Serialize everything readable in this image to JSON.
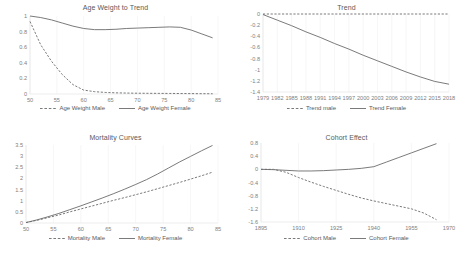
{
  "figure": {
    "panel_count": 4,
    "line_color": "#6b6b6b",
    "axis_color": "#d9d9d9",
    "text_color": "#595959"
  },
  "chart_data": [
    {
      "id": "age-weight-to-trend",
      "type": "line",
      "title": "Age Weight to Trend",
      "xlabel": "",
      "ylabel": "",
      "xlim": [
        50,
        85
      ],
      "ylim": [
        0,
        1
      ],
      "xticks": [
        50,
        55,
        60,
        65,
        70,
        75,
        80,
        85
      ],
      "yticks": [
        0,
        0.2,
        0.4,
        0.6,
        0.8,
        1
      ],
      "grid": true,
      "legend_position": "bottom",
      "x": [
        50,
        52,
        54,
        56,
        58,
        60,
        62,
        64,
        66,
        68,
        70,
        72,
        74,
        76,
        78,
        80,
        82,
        84
      ],
      "series": [
        {
          "name": "Age Weight Male",
          "style": "dashed",
          "values": [
            0.93,
            0.63,
            0.42,
            0.25,
            0.12,
            0.05,
            0.03,
            0.02,
            0.015,
            0.012,
            0.01,
            0.009,
            0.008,
            0.007,
            0.006,
            0.005,
            0.004,
            0.003
          ]
        },
        {
          "name": "Age Weight Female",
          "style": "solid",
          "values": [
            1.0,
            0.98,
            0.95,
            0.91,
            0.87,
            0.84,
            0.825,
            0.825,
            0.83,
            0.84,
            0.845,
            0.85,
            0.855,
            0.86,
            0.855,
            0.82,
            0.77,
            0.72
          ]
        }
      ]
    },
    {
      "id": "trend",
      "type": "line",
      "title": "Trend",
      "xlabel": "",
      "ylabel": "",
      "xlim": [
        1979,
        2018
      ],
      "ylim": [
        -1.4,
        0
      ],
      "xticks": [
        1979,
        1982,
        1985,
        1988,
        1991,
        1994,
        1997,
        2000,
        2003,
        2006,
        2009,
        2012,
        2015,
        2018
      ],
      "yticks": [
        0,
        -0.2,
        -0.4,
        -0.6,
        -0.8,
        -1,
        -1.2,
        -1.4
      ],
      "grid": true,
      "legend_position": "bottom",
      "x": [
        1979,
        1982,
        1985,
        1988,
        1991,
        1994,
        1997,
        2000,
        2003,
        2006,
        2009,
        2012,
        2015,
        2018
      ],
      "series": [
        {
          "name": "Trend male",
          "style": "dashed",
          "values": [
            0,
            0,
            0,
            0,
            0,
            0,
            0,
            0,
            0,
            0,
            0,
            0,
            0,
            0
          ]
        },
        {
          "name": "Trend Female",
          "style": "solid",
          "values": [
            -0.01,
            -0.11,
            -0.21,
            -0.32,
            -0.42,
            -0.53,
            -0.63,
            -0.74,
            -0.84,
            -0.94,
            -1.04,
            -1.13,
            -1.21,
            -1.26
          ]
        }
      ]
    },
    {
      "id": "mortality-curves",
      "type": "line",
      "title": "Mortality Curves",
      "xlabel": "",
      "ylabel": "",
      "xlim": [
        50,
        85
      ],
      "ylim": [
        0,
        3.5
      ],
      "xticks": [
        50,
        55,
        60,
        65,
        70,
        75,
        80,
        85
      ],
      "yticks": [
        0,
        0.5,
        1,
        1.5,
        2,
        2.5,
        3,
        3.5
      ],
      "grid": true,
      "legend_position": "bottom",
      "x": [
        50,
        52,
        54,
        56,
        58,
        60,
        62,
        64,
        66,
        68,
        70,
        72,
        74,
        76,
        78,
        80,
        82,
        84
      ],
      "series": [
        {
          "name": "Mortality Male",
          "style": "dashed",
          "values": [
            0.02,
            0.12,
            0.24,
            0.36,
            0.5,
            0.63,
            0.76,
            0.89,
            1.02,
            1.14,
            1.27,
            1.4,
            1.54,
            1.68,
            1.82,
            1.97,
            2.12,
            2.28
          ]
        },
        {
          "name": "Mortality Female",
          "style": "solid",
          "values": [
            0.02,
            0.14,
            0.28,
            0.43,
            0.6,
            0.77,
            0.95,
            1.13,
            1.32,
            1.52,
            1.73,
            1.95,
            2.2,
            2.47,
            2.74,
            2.99,
            3.24,
            3.48
          ]
        }
      ]
    },
    {
      "id": "cohort-effect",
      "type": "line",
      "title": "Cohort Effect",
      "xlabel": "",
      "ylabel": "",
      "xlim": [
        1895,
        1970
      ],
      "ylim": [
        -1.6,
        0.8
      ],
      "xticks": [
        1895,
        1910,
        1925,
        1940,
        1955,
        1970
      ],
      "yticks": [
        0.8,
        0.4,
        0,
        -0.4,
        -0.8,
        -1.2,
        -1.6
      ],
      "grid": true,
      "legend_position": "bottom",
      "x": [
        1895,
        1900,
        1905,
        1910,
        1915,
        1920,
        1925,
        1930,
        1935,
        1940,
        1945,
        1950,
        1955,
        1960,
        1965
      ],
      "series": [
        {
          "name": "Cohort Male",
          "style": "dashed",
          "values": [
            0.0,
            0.0,
            -0.09,
            -0.25,
            -0.39,
            -0.52,
            -0.64,
            -0.76,
            -0.87,
            -0.96,
            -1.04,
            -1.12,
            -1.2,
            -1.33,
            -1.53
          ]
        },
        {
          "name": "Cohort Female",
          "style": "solid",
          "values": [
            0.0,
            -0.01,
            -0.03,
            -0.05,
            -0.05,
            -0.04,
            -0.02,
            0.0,
            0.03,
            0.08,
            0.22,
            0.36,
            0.5,
            0.64,
            0.78
          ]
        }
      ]
    }
  ]
}
